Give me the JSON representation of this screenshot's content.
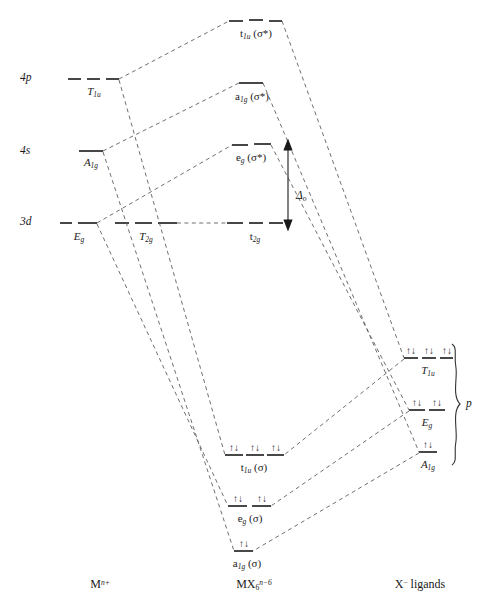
{
  "diagram": {
    "column_labels": {
      "left": {
        "text": "M",
        "sup": "n+",
        "full": "M n+"
      },
      "center": {
        "text": "MX",
        "sub": "6",
        "sup": "n−6",
        "full": "MX6 n−6"
      },
      "right": {
        "full": "X− ligands",
        "prefix": "X",
        "sup": "−",
        "suffix": " ligands"
      }
    },
    "atomic_orbitals": [
      {
        "name": "4p-level",
        "axis_label": "4p",
        "term": "T",
        "term_sub": "1u",
        "y": 79,
        "x1": 68,
        "x2": 118
      },
      {
        "name": "4s-level",
        "axis_label": "4s",
        "term": "A",
        "term_sub": "1g",
        "y": 152,
        "x1": 78,
        "x2": 110
      },
      {
        "name": "3d-level-eg",
        "axis_label": "3d",
        "term": "E",
        "term_sub": "g",
        "y": 223,
        "x1": 62,
        "x2": 98
      },
      {
        "name": "3d-level-t2g",
        "axis_label": "",
        "term": "T",
        "term_sub": "2g",
        "y": 223,
        "x1": 115,
        "x2": 180
      }
    ],
    "molecular_orbitals": [
      {
        "name": "t1u-antibonding",
        "label": "t",
        "sub": "1u",
        "suffix": " (σ*)",
        "y": 21,
        "x1": 229,
        "x2": 279,
        "electrons": 0
      },
      {
        "name": "a1g-antibonding",
        "label": "a",
        "sub": "1g",
        "suffix": " (σ*)",
        "y": 84,
        "x1": 238,
        "x2": 264,
        "electrons": 0
      },
      {
        "name": "eg-antibonding",
        "label": "e",
        "sub": "g",
        "suffix": " (σ*)",
        "y": 145,
        "x1": 232,
        "x2": 272,
        "electrons": 0
      },
      {
        "name": "t2g-nonbonding",
        "label": "t",
        "sub": "2g",
        "suffix": "",
        "y": 223,
        "x1": 227,
        "x2": 281,
        "electrons": 0
      },
      {
        "name": "t1u-bonding",
        "label": "t",
        "sub": "1u",
        "suffix": " (σ)",
        "y": 455,
        "x1": 224,
        "x2": 283,
        "electrons": 6,
        "pairs": 3
      },
      {
        "name": "eg-bonding",
        "label": "e",
        "sub": "g",
        "suffix": " (σ)",
        "y": 506,
        "x1": 228,
        "x2": 272,
        "electrons": 4,
        "pairs": 2
      },
      {
        "name": "a1g-bonding",
        "label": "a",
        "sub": "1g",
        "suffix": " (σ)",
        "y": 551,
        "x1": 233,
        "x2": 254,
        "electrons": 2,
        "pairs": 1
      }
    ],
    "ligand_orbitals": [
      {
        "name": "ligand-t1u",
        "term": "T",
        "term_sub": "1u",
        "y": 358,
        "x1": 404,
        "x2": 451,
        "pairs": 3
      },
      {
        "name": "ligand-eg",
        "term": "E",
        "term_sub": "g",
        "y": 410,
        "x1": 410,
        "x2": 445,
        "pairs": 2
      },
      {
        "name": "ligand-a1g",
        "term": "A",
        "term_sub": "1g",
        "y": 452,
        "x1": 419,
        "x2": 437,
        "pairs": 1
      }
    ],
    "brace": {
      "name": "ligand-brace",
      "label": "p",
      "x": 456,
      "top": 344,
      "bottom": 465
    },
    "splitting": {
      "name": "delta-o-arrow",
      "label": "Δ",
      "sublabel": "o",
      "x": 288,
      "top": 147,
      "bottom": 223
    },
    "electron_glyph": "↑↓",
    "colors": {
      "line": "#1a1a1a",
      "dashed": "#4a4a4a",
      "background": "#ffffff"
    }
  }
}
